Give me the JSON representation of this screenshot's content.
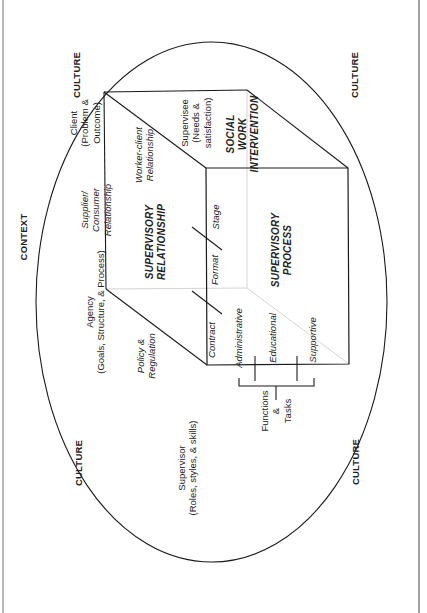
{
  "diagram": {
    "title": "CONTEXT",
    "corner_labels": [
      "CULTURE",
      "CULTURE",
      "CULTURE",
      "CULTURE"
    ],
    "outer_labels": {
      "client": "Client\n(Problem &\nOutcome)",
      "agency": "Agency\n(Goals, Structure, & Process)",
      "supervisor": "Supervisor\n(Roles, styles, & skills)",
      "functions_tasks": "Functions\n&\nTasks"
    },
    "relationship_labels": {
      "supplier_consumer": "Supplier/\nConsumer\nRelationship",
      "worker_client": "Worker-client\nRelationship",
      "policy_regulation": "Policy &\nRegulation",
      "supervisee": "Supervisee\n(Needs &\nsatisfaction)"
    },
    "box_faces": {
      "top": "SUPERVISORY\nRELATIONSHIP",
      "front": "SUPERVISORY\nPROCESS",
      "side": "SOCIAL\nWORK\nINTERVENTION"
    },
    "process_stages": [
      "Contract",
      "Format",
      "Stage"
    ],
    "functions": [
      "Administrative",
      "Educational",
      "Supportive"
    ],
    "colors": {
      "line": "#1a1a1a",
      "faint_line": "#cfcfcf",
      "text": "#222222",
      "background": "#ffffff"
    }
  }
}
